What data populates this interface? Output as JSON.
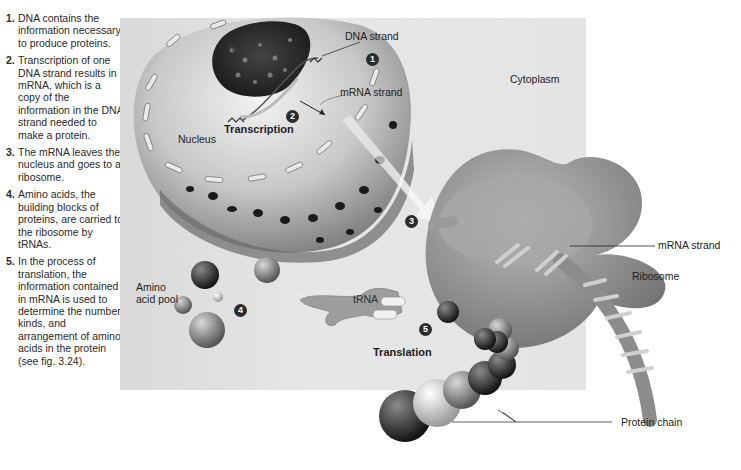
{
  "steps": [
    {
      "num": "1.",
      "text": "DNA contains the information necessary to produce proteins."
    },
    {
      "num": "2.",
      "text": "Transcription of one DNA strand results in mRNA, which is a copy of the information in the DNA strand needed to make a protein."
    },
    {
      "num": "3.",
      "text": "The mRNA leaves the nucleus and goes to a ribosome."
    },
    {
      "num": "4.",
      "text": "Amino acids, the building blocks of proteins, are carried to the ribosome by tRNAs."
    },
    {
      "num": "5.",
      "text": "In the process of translation, the information contained in mRNA is used to determine the number, kinds, and arrangement of amino acids in the protein (see fig. 3.24)."
    }
  ],
  "labels": {
    "nucleolus": "Nucleolus",
    "dna_strand": "DNA strand",
    "mrna_strand_nucleus": "mRNA strand",
    "nucleus": "Nucleus",
    "transcription": "Transcription",
    "cytoplasm": "Cytoplasm",
    "mrna_strand_ribosome": "mRNA strand",
    "ribosome": "Ribosome",
    "amino_acid_pool": "Amino acid pool",
    "trna": "tRNA",
    "translation": "Translation",
    "protein_chain": "Protein chain"
  },
  "badges": [
    "1",
    "2",
    "3",
    "4",
    "5"
  ]
}
